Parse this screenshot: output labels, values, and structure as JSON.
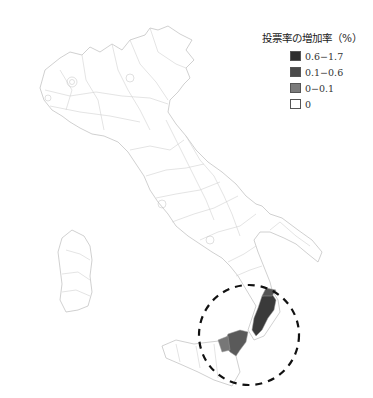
{
  "legend": {
    "title": "投票率の増加率（%）",
    "items": [
      {
        "label": "0.6−1.7",
        "color": "#2e2e2e"
      },
      {
        "label": "0.1−0.6",
        "color": "#4a4a4a"
      },
      {
        "label": "0−0.1",
        "color": "#7a7a7a"
      },
      {
        "label": "0",
        "color": "#ffffff"
      }
    ]
  },
  "map": {
    "region": "Italy",
    "boundary_color": "#c8c8c8",
    "highlight_circle": {
      "style": "dashed",
      "color": "#111111",
      "area": "Calabria / NE Sicily"
    }
  }
}
